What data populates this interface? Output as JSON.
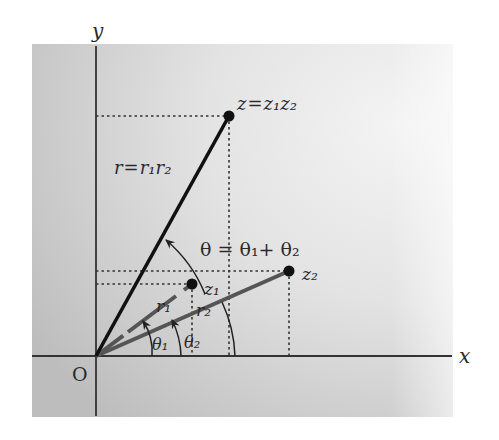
{
  "diagram": {
    "axes": {
      "x_label": "x",
      "y_label": "y",
      "origin_label": "O"
    },
    "points": {
      "z": {
        "label": "z = z₁z₂",
        "label_z": "z",
        "label_eq": "=",
        "label_rhs": "z₁z₂",
        "x": 229,
        "y": 116
      },
      "z1": {
        "label": "z₁",
        "x": 192,
        "y": 284
      },
      "z2": {
        "label": "z₂",
        "x": 289,
        "y": 271
      }
    },
    "labels": {
      "r_product": "r = r₁r₂",
      "r_product_lhs": "r",
      "r_product_eq": "=",
      "r_product_rhs": "r₁r₂",
      "r1": "r₁",
      "r2": "r₂",
      "theta_sum": "θ = θ₁+ θ₂",
      "theta1": "θ₁",
      "theta2": "θ₂"
    },
    "colors": {
      "background_panel": "#d9d9d9",
      "axis": "#333333",
      "vector_z": "#111111",
      "vector_z1_z2": "#555555",
      "dotted_guides": "#333333"
    }
  }
}
